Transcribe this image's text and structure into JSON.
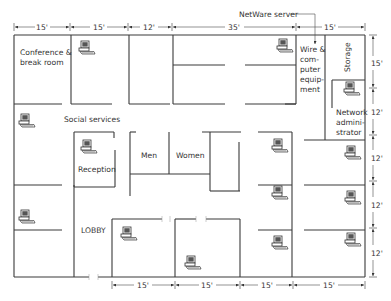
{
  "annotation": {
    "label": "NetWare server",
    "icon": "arrow-down"
  },
  "rooms": [
    {
      "id": "conference",
      "lines": [
        "Conference &",
        "break room"
      ]
    },
    {
      "id": "social",
      "lines": [
        "Social services"
      ]
    },
    {
      "id": "reception",
      "lines": [
        "Reception"
      ]
    },
    {
      "id": "men",
      "lines": [
        "Men"
      ]
    },
    {
      "id": "women",
      "lines": [
        "Women"
      ]
    },
    {
      "id": "lobby",
      "lines": [
        "LOBBY"
      ]
    },
    {
      "id": "wire",
      "lines": [
        "Wire &",
        "com-",
        "puter",
        "equip-",
        "ment"
      ]
    },
    {
      "id": "storage",
      "lines": [
        "Storage"
      ]
    },
    {
      "id": "netadmin",
      "lines": [
        "Network",
        "admini-",
        "strator"
      ]
    }
  ],
  "dimensions": {
    "top": [
      "15'",
      "15'",
      "12'",
      "35'",
      "15'"
    ],
    "right": [
      "15'",
      "12'",
      "12'",
      "12'",
      "12'"
    ],
    "bottom": [
      "15'",
      "15'",
      "15'",
      "15'"
    ]
  },
  "computers": {
    "icon": "computer-workstation-icon",
    "count": 14
  }
}
